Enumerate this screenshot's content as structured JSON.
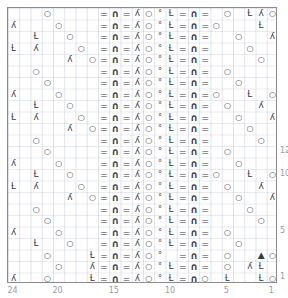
{
  "chart_data": {
    "type": "heatmap",
    "title": "",
    "xlabel": "",
    "ylabel": "",
    "columns": 24,
    "rows": 24,
    "column_tick_labels": [
      "24",
      "20",
      "15",
      "10",
      "5",
      "1"
    ],
    "column_tick_values": [
      24,
      20,
      15,
      10,
      5,
      1
    ],
    "row_tick_labels": [
      "12",
      "10",
      "5",
      "1"
    ],
    "row_tick_values": [
      12,
      10,
      5,
      1
    ],
    "grid": true,
    "legend_position": "none",
    "symbol_glyphs": {
      "blank": "",
      "purl": "=",
      "bind": "∩",
      "yo": "○",
      "k2tog": "ʎ",
      "ssk": "ʎ",
      "cdd": "Ɫ",
      "dot": "°"
    },
    "symbol_names": {
      "blank": "knit",
      "purl": "purl-dash",
      "bind": "bind-arch",
      "yo": "yarn-over",
      "k2tog": "k2tog-right-lean",
      "ssk": "ssk-left-lean",
      "cdd": "centered-double-dec",
      "dot": "small-dot"
    },
    "motif_right": "=∩=ʎ○ °Ɫ=∩=",
    "rows_data": [
      {
        "row": 24,
        "cells": [
          "b",
          "b",
          "b",
          "yo",
          "b",
          "b",
          "b",
          "b",
          "p",
          "bd",
          "p",
          "k",
          "yo",
          "d",
          "c",
          "p",
          "bd",
          "p",
          "b",
          "yo",
          "b",
          "c",
          "k",
          "yo"
        ]
      },
      {
        "row": 23,
        "cells": [
          "k",
          "b",
          "b",
          "b",
          "yo",
          "b",
          "b",
          "b",
          "p",
          "bd",
          "p",
          "k",
          "yo",
          "d",
          "c",
          "p",
          "bd",
          "p",
          "yo",
          "b",
          "b",
          "b",
          "c",
          "b"
        ]
      },
      {
        "row": 22,
        "cells": [
          "b",
          "b",
          "c",
          "b",
          "b",
          "yo",
          "b",
          "b",
          "p",
          "bd",
          "p",
          "k",
          "yo",
          "d",
          "c",
          "p",
          "bd",
          "p",
          "b",
          "b",
          "yo",
          "b",
          "b",
          "k"
        ]
      },
      {
        "row": 21,
        "cells": [
          "c",
          "b",
          "k",
          "b",
          "b",
          "b",
          "yo",
          "b",
          "p",
          "bd",
          "p",
          "k",
          "yo",
          "d",
          "c",
          "p",
          "bd",
          "p",
          "b",
          "b",
          "b",
          "yo",
          "b",
          "b"
        ]
      },
      {
        "row": 20,
        "cells": [
          "b",
          "b",
          "b",
          "b",
          "b",
          "k",
          "b",
          "yo",
          "p",
          "bd",
          "p",
          "k",
          "yo",
          "d",
          "c",
          "p",
          "bd",
          "p",
          "b",
          "b",
          "b",
          "b",
          "yo",
          "b"
        ]
      },
      {
        "row": 19,
        "cells": [
          "b",
          "b",
          "yo",
          "b",
          "b",
          "b",
          "b",
          "b",
          "p",
          "bd",
          "p",
          "k",
          "yo",
          "d",
          "c",
          "p",
          "bd",
          "p",
          "b",
          "yo",
          "b",
          "b",
          "b",
          "b"
        ]
      },
      {
        "row": 18,
        "cells": [
          "b",
          "b",
          "b",
          "yo",
          "b",
          "b",
          "b",
          "b",
          "p",
          "bd",
          "p",
          "k",
          "yo",
          "d",
          "c",
          "p",
          "bd",
          "p",
          "b",
          "b",
          "yo",
          "b",
          "b",
          "b"
        ]
      },
      {
        "row": 17,
        "cells": [
          "k",
          "b",
          "b",
          "b",
          "yo",
          "b",
          "b",
          "b",
          "p",
          "bd",
          "p",
          "k",
          "yo",
          "d",
          "c",
          "p",
          "bd",
          "p",
          "yo",
          "b",
          "b",
          "c",
          "b",
          "yo"
        ]
      },
      {
        "row": 16,
        "cells": [
          "b",
          "b",
          "c",
          "b",
          "b",
          "yo",
          "b",
          "b",
          "p",
          "bd",
          "p",
          "k",
          "yo",
          "d",
          "c",
          "p",
          "bd",
          "p",
          "b",
          "yo",
          "b",
          "b",
          "k",
          "b"
        ]
      },
      {
        "row": 15,
        "cells": [
          "c",
          "b",
          "k",
          "b",
          "b",
          "b",
          "yo",
          "b",
          "p",
          "bd",
          "p",
          "k",
          "yo",
          "d",
          "c",
          "p",
          "bd",
          "p",
          "b",
          "b",
          "yo",
          "b",
          "b",
          "k"
        ]
      },
      {
        "row": 14,
        "cells": [
          "b",
          "b",
          "b",
          "b",
          "b",
          "k",
          "b",
          "yo",
          "p",
          "bd",
          "p",
          "k",
          "yo",
          "d",
          "c",
          "p",
          "bd",
          "p",
          "b",
          "b",
          "b",
          "yo",
          "b",
          "b"
        ]
      },
      {
        "row": 13,
        "cells": [
          "b",
          "b",
          "yo",
          "b",
          "b",
          "b",
          "b",
          "b",
          "p",
          "bd",
          "p",
          "k",
          "yo",
          "d",
          "c",
          "p",
          "bd",
          "p",
          "b",
          "b",
          "b",
          "b",
          "yo",
          "b"
        ]
      },
      {
        "row": 12,
        "cells": [
          "b",
          "b",
          "b",
          "yo",
          "b",
          "b",
          "b",
          "b",
          "p",
          "bd",
          "p",
          "k",
          "yo",
          "d",
          "c",
          "p",
          "bd",
          "p",
          "b",
          "yo",
          "b",
          "b",
          "b",
          "b"
        ]
      },
      {
        "row": 11,
        "cells": [
          "k",
          "b",
          "b",
          "b",
          "yo",
          "b",
          "b",
          "b",
          "p",
          "bd",
          "p",
          "k",
          "yo",
          "d",
          "c",
          "p",
          "bd",
          "p",
          "b",
          "b",
          "yo",
          "b",
          "b",
          "b"
        ]
      },
      {
        "row": 10,
        "cells": [
          "b",
          "b",
          "c",
          "b",
          "b",
          "yo",
          "b",
          "b",
          "p",
          "bd",
          "p",
          "k",
          "yo",
          "d",
          "c",
          "p",
          "bd",
          "p",
          "yo",
          "b",
          "b",
          "c",
          "b",
          "yo"
        ]
      },
      {
        "row": 9,
        "cells": [
          "c",
          "b",
          "k",
          "b",
          "b",
          "b",
          "yo",
          "b",
          "p",
          "bd",
          "p",
          "k",
          "yo",
          "d",
          "c",
          "p",
          "bd",
          "p",
          "b",
          "yo",
          "b",
          "b",
          "k",
          "b"
        ]
      },
      {
        "row": 8,
        "cells": [
          "b",
          "b",
          "b",
          "b",
          "b",
          "k",
          "b",
          "yo",
          "p",
          "bd",
          "p",
          "k",
          "yo",
          "d",
          "c",
          "p",
          "bd",
          "p",
          "b",
          "b",
          "yo",
          "b",
          "b",
          "k"
        ]
      },
      {
        "row": 7,
        "cells": [
          "b",
          "b",
          "yo",
          "b",
          "b",
          "b",
          "b",
          "b",
          "p",
          "bd",
          "p",
          "k",
          "yo",
          "d",
          "c",
          "p",
          "bd",
          "p",
          "b",
          "b",
          "b",
          "yo",
          "b",
          "b"
        ]
      },
      {
        "row": 6,
        "cells": [
          "b",
          "b",
          "b",
          "yo",
          "b",
          "b",
          "b",
          "b",
          "p",
          "bd",
          "p",
          "k",
          "yo",
          "d",
          "c",
          "p",
          "bd",
          "p",
          "b",
          "b",
          "b",
          "b",
          "yo",
          "b"
        ]
      },
      {
        "row": 5,
        "cells": [
          "k",
          "b",
          "b",
          "b",
          "yo",
          "b",
          "b",
          "b",
          "p",
          "bd",
          "p",
          "k",
          "yo",
          "d",
          "c",
          "p",
          "bd",
          "p",
          "b",
          "yo",
          "b",
          "b",
          "b",
          "b"
        ]
      },
      {
        "row": 4,
        "cells": [
          "b",
          "b",
          "c",
          "b",
          "b",
          "yo",
          "b",
          "b",
          "p",
          "bd",
          "p",
          "k",
          "yo",
          "d",
          "c",
          "p",
          "bd",
          "p",
          "b",
          "b",
          "yo",
          "b",
          "b",
          "b"
        ]
      },
      {
        "row": 3,
        "cells": [
          "b",
          "b",
          "b",
          "yo",
          "b",
          "b",
          "b",
          "c",
          "p",
          "bd",
          "p",
          "k",
          "yo",
          "d",
          "b",
          "p",
          "bd",
          "p",
          "b",
          "yo",
          "b",
          "b",
          "cd",
          "yo"
        ]
      },
      {
        "row": 2,
        "cells": [
          "b",
          "b",
          "b",
          "b",
          "yo",
          "b",
          "b",
          "k",
          "p",
          "bd",
          "p",
          "k",
          "yo",
          "d",
          "c",
          "p",
          "bd",
          "p",
          "b",
          "yo",
          "b",
          "k",
          "c",
          "b"
        ]
      },
      {
        "row": 1,
        "cells": [
          "k",
          "b",
          "b",
          "yo",
          "b",
          "b",
          "b",
          "c",
          "p",
          "bd",
          "p",
          "k",
          "yo",
          "d",
          "c",
          "p",
          "bd",
          "yo",
          "b",
          "c",
          "b",
          "b",
          "c",
          "yo"
        ]
      }
    ]
  }
}
